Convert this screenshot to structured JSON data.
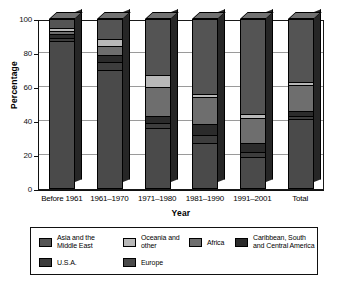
{
  "chart_data": {
    "type": "bar",
    "subtype": "stacked-bar-3d",
    "title": "",
    "xlabel": "Year",
    "ylabel": "Percentage",
    "ylim": [
      0,
      100
    ],
    "yticks": [
      0,
      20,
      40,
      60,
      80,
      100
    ],
    "grid": true,
    "legend_position": "bottom",
    "stack_order_bottom_to_top": [
      "Europe",
      "U.S.A.",
      "Caribbean, South and Central America",
      "Africa",
      "Oceania and other",
      "Asia and the Middle East"
    ],
    "categories": [
      "Before 1961",
      "1961–1970",
      "1971–1980",
      "1981–1990",
      "1991–2001",
      "Total"
    ],
    "series": [
      {
        "name": "Europe",
        "color": "#4a4a4a",
        "values": [
          87,
          70,
          36,
          27,
          19,
          41
        ]
      },
      {
        "name": "U.S.A.",
        "color": "#3d3d3d",
        "values": [
          2,
          5,
          3,
          5,
          3,
          2
        ]
      },
      {
        "name": "Caribbean, South and Central America",
        "color": "#2b2b2b",
        "values": [
          2,
          4,
          4,
          6,
          5,
          3
        ]
      },
      {
        "name": "Africa",
        "color": "#6e6e6e",
        "values": [
          2,
          5,
          17,
          16,
          15,
          15
        ]
      },
      {
        "name": "Oceania and other",
        "color": "#b8b8b8",
        "values": [
          2,
          4,
          7,
          2,
          2,
          2
        ]
      },
      {
        "name": "Asia and the Middle East",
        "color": "#545454",
        "values": [
          5,
          12,
          33,
          44,
          56,
          37
        ]
      }
    ]
  },
  "legend": {
    "entries": [
      {
        "label": "Asia and the Middle East",
        "color": "#545454"
      },
      {
        "label": "Oceania and other",
        "color": "#b8b8b8"
      },
      {
        "label": "Africa",
        "color": "#6e6e6e"
      },
      {
        "label": "Caribbean, South and Central America",
        "color": "#2b2b2b"
      },
      {
        "label": "U.S.A.",
        "color": "#3d3d3d"
      },
      {
        "label": "Europe",
        "color": "#4a4a4a"
      }
    ]
  }
}
